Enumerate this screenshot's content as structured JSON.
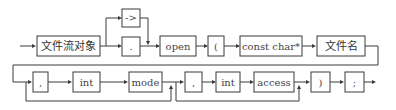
{
  "diagram": {
    "type": "syntax-diagram",
    "row1": [
      {
        "id": "stream",
        "label": "文件流对象"
      },
      {
        "id": "arrow_op",
        "label": "->"
      },
      {
        "id": "dot_op",
        "label": "."
      },
      {
        "id": "open",
        "label": "open"
      },
      {
        "id": "lparen",
        "label": "("
      },
      {
        "id": "const_char",
        "label": "const char*"
      },
      {
        "id": "filename",
        "label": "文件名"
      }
    ],
    "row2": [
      {
        "id": "comma1",
        "label": ","
      },
      {
        "id": "int1",
        "label": "int"
      },
      {
        "id": "mode",
        "label": "mode"
      },
      {
        "id": "comma2",
        "label": ","
      },
      {
        "id": "int2",
        "label": "int"
      },
      {
        "id": "access",
        "label": "access"
      },
      {
        "id": "rparen",
        "label": ")"
      },
      {
        "id": "semicolon",
        "label": ";"
      }
    ],
    "line_color": "#3a3a3a"
  }
}
